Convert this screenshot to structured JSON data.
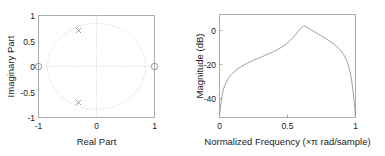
{
  "figure": {
    "background": "#ffffff",
    "line_color": "#8f8f8f",
    "frame_color": "#9a9a9a",
    "grid_color": "#c8c8c8"
  },
  "chart_data": [
    {
      "type": "scatter",
      "name": "pole-zero-plot",
      "title": "",
      "xlabel": "Real Part",
      "ylabel": "Imaginary Part",
      "xlim": [
        -1.18,
        1.18
      ],
      "ylim": [
        -1.18,
        1.18
      ],
      "xticks": [
        -1,
        0,
        1
      ],
      "xticklabels": [
        "-1",
        "0",
        "1"
      ],
      "yticks": [
        -1,
        -0.5,
        0,
        0.5,
        1
      ],
      "yticklabels": [
        "-1",
        "-0.5",
        "0",
        "0.5",
        "1"
      ],
      "grid": true,
      "unit_circle": true,
      "series": [
        {
          "name": "Poles",
          "marker": "x",
          "points": [
            {
              "x": -0.35,
              "y": 0.72
            },
            {
              "x": -0.35,
              "y": -0.72
            }
          ]
        },
        {
          "name": "Zeros",
          "marker": "o",
          "points": [
            {
              "x": -1.0,
              "y": 0.0
            },
            {
              "x": 1.0,
              "y": 0.0
            }
          ]
        }
      ]
    },
    {
      "type": "line",
      "name": "magnitude-response",
      "title": "",
      "xlabel": "Normalized Frequency (×π rad/sample)",
      "ylabel": "Magnitude (dB)",
      "xlim": [
        0,
        1
      ],
      "ylim": [
        -48,
        6
      ],
      "xticks": [
        0,
        0.5,
        1
      ],
      "xticklabels": [
        "0",
        "0.5",
        "1"
      ],
      "yticks": [
        0,
        -20,
        -40
      ],
      "yticklabels": [
        "0",
        "-20",
        "-40"
      ],
      "grid": false,
      "x": [
        0.0,
        0.005,
        0.01,
        0.02,
        0.03,
        0.04,
        0.05,
        0.06,
        0.07,
        0.08,
        0.09,
        0.1,
        0.12,
        0.14,
        0.16,
        0.18,
        0.2,
        0.22,
        0.25,
        0.28,
        0.31,
        0.34,
        0.37,
        0.4,
        0.43,
        0.46,
        0.49,
        0.52,
        0.55,
        0.57,
        0.59,
        0.6,
        0.61,
        0.615,
        0.62,
        0.625,
        0.63,
        0.65,
        0.67,
        0.7,
        0.73,
        0.76,
        0.79,
        0.82,
        0.85,
        0.88,
        0.9,
        0.92,
        0.94,
        0.95,
        0.96,
        0.97,
        0.975,
        0.98,
        0.985,
        0.99,
        0.995,
        1.0
      ],
      "y": [
        -47.0,
        -44.0,
        -40.5,
        -36.0,
        -33.0,
        -31.0,
        -29.4,
        -28.1,
        -27.0,
        -26.1,
        -25.3,
        -24.6,
        -23.3,
        -22.2,
        -21.3,
        -20.5,
        -19.7,
        -19.0,
        -18.0,
        -17.1,
        -16.2,
        -15.3,
        -14.4,
        -13.4,
        -12.3,
        -11.0,
        -9.5,
        -7.6,
        -5.3,
        -3.6,
        -1.8,
        -1.0,
        -0.4,
        -0.15,
        -0.02,
        -0.05,
        -0.2,
        -0.9,
        -1.8,
        -3.1,
        -4.4,
        -5.7,
        -7.0,
        -8.4,
        -10.0,
        -12.0,
        -13.7,
        -15.9,
        -19.0,
        -21.2,
        -24.0,
        -27.8,
        -30.2,
        -33.2,
        -36.0,
        -39.5,
        -43.0,
        -47.5
      ]
    }
  ]
}
